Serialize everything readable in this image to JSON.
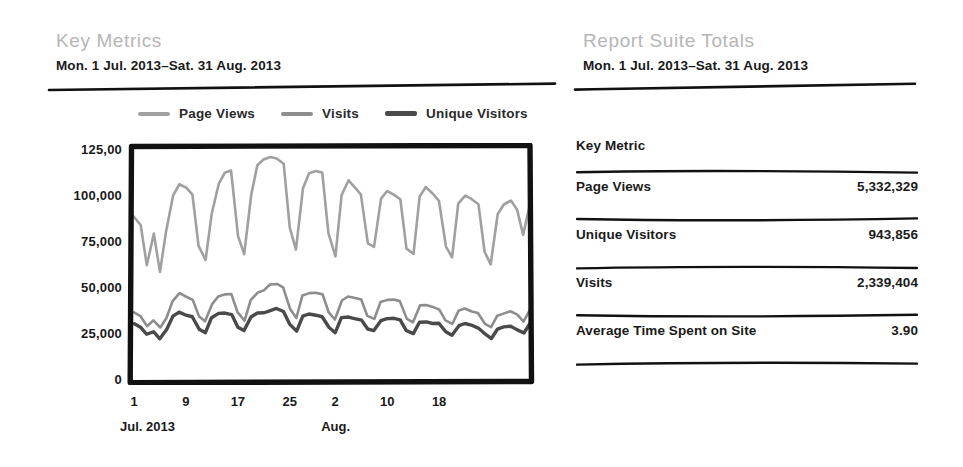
{
  "left_panel": {
    "title": "Key Metrics",
    "subtitle": "Mon. 1 Jul. 2013–Sat. 31 Aug. 2013"
  },
  "right_panel": {
    "title": "Report Suite Totals",
    "subtitle": "Mon. 1 Jul. 2013–Sat. 31 Aug. 2013"
  },
  "legend": [
    {
      "label": "Page Views",
      "color": "#a0a0a0",
      "thickness": 4
    },
    {
      "label": "Visits",
      "color": "#8d8d8d",
      "thickness": 4
    },
    {
      "label": "Unique Visitors",
      "color": "#4a4a4a",
      "thickness": 5
    }
  ],
  "table": {
    "header": "Key Metric",
    "rows": [
      {
        "label": "Page Views",
        "value": "5,332,329"
      },
      {
        "label": "Unique Visitors",
        "value": "943,856"
      },
      {
        "label": "Visits",
        "value": "2,339,404"
      },
      {
        "label": "Average Time Spent on Site",
        "value": "3.90"
      }
    ]
  },
  "chart_data": {
    "type": "line",
    "title": "Key Metrics",
    "subtitle": "Mon. 1 Jul. 2013–Sat. 31 Aug. 2013",
    "xlabel": "",
    "ylabel": "",
    "ylim": [
      0,
      125000
    ],
    "yticks": [
      0,
      25000,
      50000,
      75000,
      100000,
      125000
    ],
    "ytick_labels": [
      "0",
      "25,000",
      "50,000",
      "75,000",
      "100,000",
      "125,00"
    ],
    "grid": false,
    "legend_position": "top",
    "x_axis_months": [
      {
        "label": "Jul. 2013",
        "day_index": 1
      },
      {
        "label": "Aug.",
        "day_index": 32
      }
    ],
    "xtick_labels": [
      "1",
      "9",
      "17",
      "25",
      "2",
      "10",
      "18"
    ],
    "xtick_day_indices": [
      1,
      9,
      17,
      25,
      32,
      40,
      48
    ],
    "x": [
      1,
      2,
      3,
      4,
      5,
      6,
      7,
      8,
      9,
      10,
      11,
      12,
      13,
      14,
      15,
      16,
      17,
      18,
      19,
      20,
      21,
      22,
      23,
      24,
      25,
      26,
      27,
      28,
      29,
      30,
      31,
      32,
      33,
      34,
      35,
      36,
      37,
      38,
      39,
      40,
      41,
      42,
      43,
      44,
      45,
      46,
      47,
      48,
      49,
      50,
      51,
      52,
      53,
      54,
      55,
      56,
      57,
      58,
      59,
      60,
      61,
      62
    ],
    "series": [
      {
        "name": "Page Views",
        "color": "#a0a0a0",
        "values": [
          88000,
          84000,
          62000,
          79000,
          58000,
          80000,
          100000,
          106000,
          104000,
          100000,
          72000,
          65000,
          90000,
          106000,
          112000,
          113000,
          78000,
          68000,
          100000,
          116000,
          119000,
          121000,
          120000,
          117000,
          82000,
          70000,
          104000,
          112000,
          113000,
          112000,
          79000,
          67000,
          100000,
          108000,
          104000,
          100000,
          74000,
          72000,
          98000,
          102000,
          100000,
          98000,
          71000,
          68000,
          99000,
          104000,
          101000,
          97000,
          72000,
          66000,
          95000,
          100000,
          98000,
          95000,
          69000,
          62000,
          90000,
          95000,
          97000,
          92000,
          78000,
          96000
        ]
      },
      {
        "name": "Visits",
        "color": "#8d8d8d",
        "values": [
          36000,
          34000,
          29000,
          32000,
          28000,
          33000,
          42000,
          47000,
          45000,
          43000,
          34000,
          31000,
          41000,
          45000,
          46000,
          46000,
          36000,
          32000,
          43000,
          47000,
          48000,
          51000,
          52000,
          50000,
          38000,
          33000,
          45000,
          47000,
          47000,
          46000,
          36000,
          32000,
          43000,
          45000,
          44000,
          43000,
          34000,
          33000,
          42000,
          43000,
          43000,
          42000,
          33000,
          31000,
          40000,
          40000,
          39000,
          38000,
          32000,
          30000,
          37000,
          38000,
          37000,
          36000,
          30000,
          28000,
          34000,
          36000,
          37000,
          35000,
          31000,
          37000
        ]
      },
      {
        "name": "Unique Visitors",
        "color": "#4a4a4a",
        "values": [
          30000,
          28000,
          24000,
          26000,
          22000,
          27000,
          34000,
          36000,
          35000,
          34000,
          27000,
          25000,
          33000,
          36000,
          36000,
          35000,
          28000,
          26000,
          34000,
          36000,
          36000,
          37000,
          38000,
          37000,
          30000,
          26000,
          34000,
          35000,
          35000,
          34000,
          28000,
          25000,
          33000,
          34000,
          33000,
          32000,
          27000,
          26000,
          32000,
          33000,
          33000,
          32000,
          26000,
          25000,
          31000,
          31000,
          30000,
          30000,
          26000,
          24000,
          29000,
          30000,
          29000,
          28000,
          25000,
          22000,
          27000,
          28000,
          29000,
          27000,
          25000,
          30000
        ]
      }
    ]
  }
}
